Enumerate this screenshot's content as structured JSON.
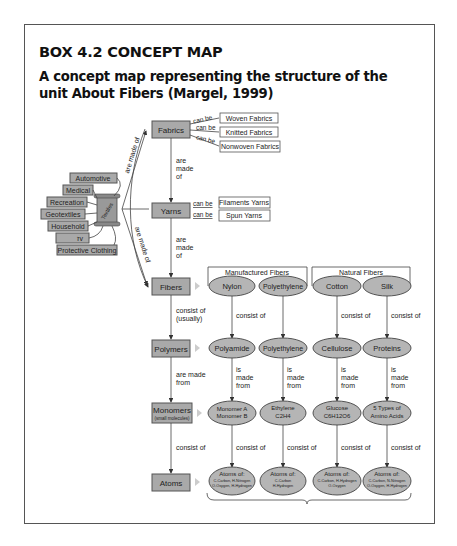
{
  "header": {
    "title": "BOX 4.2  CONCEPT MAP",
    "subtitle": "A concept map representing the structure of the unit About Fibers (Margel, 1999)"
  },
  "colors": {
    "node_fill": "#a9a9a9",
    "ellipse_fill": "#b5b5b5",
    "border": "#555555"
  },
  "diagram": {
    "main_nodes": {
      "fabrics": "Fabrics",
      "yarns": "Yarns",
      "fibers": "Fibers",
      "polymers": "Polymers",
      "monomers": "Monomers",
      "monomers_sub": "(small molecules)",
      "atoms": "Atoms"
    },
    "fabric_types": [
      "Woven Fabrics",
      "Knitted Fabrics",
      "Nonwoven Fabrics"
    ],
    "yarn_types": [
      "Filaments Yarns",
      "Spun Yarns"
    ],
    "uses": {
      "center": "Textiles",
      "items": [
        "Automotive",
        "Medical",
        "Recreation",
        "Geotextiles",
        "Household",
        "זv",
        "Protective Clothing"
      ]
    },
    "links": {
      "can_be": "can be",
      "are_made_of": "are made of",
      "are": "are",
      "made": "made",
      "of": "of",
      "consist_of": "consist of",
      "usually": "(usually)",
      "are_made_from_1": "are made",
      "are_made_from_2": "from",
      "is": "is",
      "from": "from"
    },
    "groups": {
      "manufactured": "Manufactured Fibers",
      "natural": "Natural Fibers"
    },
    "columns": [
      {
        "fiber": "Nylon",
        "polymer": "Polyamide",
        "monomer": [
          "Monomer A",
          "Monomer B"
        ],
        "atoms": [
          "Atoms of:",
          "C-Carbon, H-Nitrogen",
          "O-Oxygen, H-Hydrogen"
        ]
      },
      {
        "fiber": "Polyethylene",
        "polymer": "Polyethylene",
        "monomer": [
          "Ethylene",
          "C2H4"
        ],
        "atoms": [
          "Atoms of:",
          "C-Carbon",
          "H-Hydrogen"
        ]
      },
      {
        "fiber": "Cotton",
        "polymer": "Cellulose",
        "monomer": [
          "Glucose",
          "C6H12O6"
        ],
        "atoms": [
          "Atoms of:",
          "C-Carbon, H-Hydrogen",
          "O-Oxygen"
        ]
      },
      {
        "fiber": "Silk",
        "polymer": "Proteins",
        "monomer": [
          "5 Types of",
          "Amino Acids"
        ],
        "atoms": [
          "Atoms of:",
          "C-Carbon, N-Nitrogen",
          "O-Oxygen, H-Hydrogen"
        ]
      }
    ]
  }
}
